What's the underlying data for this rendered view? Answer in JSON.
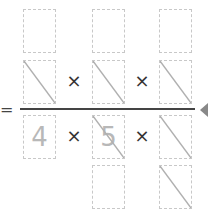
{
  "equation": {
    "equals_sign": "=",
    "times_sign": "×",
    "numerator": {
      "rows": [
        [
          {
            "value": "",
            "struck": false
          },
          {
            "value": "",
            "struck": false
          },
          {
            "value": "",
            "struck": false
          }
        ],
        [
          {
            "value": "",
            "struck": true
          },
          {
            "value": "",
            "struck": true
          },
          {
            "value": "",
            "struck": true
          }
        ]
      ]
    },
    "denominator": {
      "rows": [
        [
          {
            "value": "4",
            "struck": false
          },
          {
            "value": "5",
            "struck": true
          },
          {
            "value": "",
            "struck": true
          }
        ],
        [
          {
            "value": "",
            "struck": false
          },
          {
            "value": "",
            "struck": false
          },
          {
            "value": "",
            "struck": true
          }
        ]
      ]
    }
  },
  "colors": {
    "cell_border": "#c8c8c8",
    "slash": "#b0b0b0",
    "digit": "#b8b8b8",
    "fraction_bar": "#444444",
    "pointer": "#888888"
  }
}
